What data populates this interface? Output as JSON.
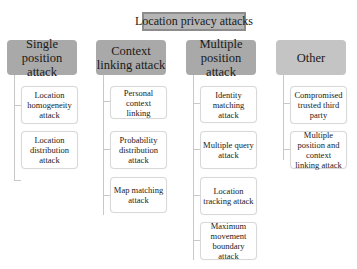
{
  "title": "Location privacy attacks",
  "colors": {
    "title_bg": "#b5b5b5",
    "title_border": "#8c8c8c",
    "category_dark": "#a9a9a9",
    "category_light": "#c4c4c4",
    "child_border": "#d8d8d8",
    "connector": "#c8c8c8"
  },
  "categories": [
    {
      "label": "Single position attack",
      "children": [
        "Location homogeneity attack",
        "Location distribution attack"
      ]
    },
    {
      "label": "Context linking attack",
      "children": [
        "Personal context linking",
        "Probability distribution attack",
        "Map matching attack"
      ]
    },
    {
      "label": "Multiple position attack",
      "children": [
        "Identity matching attack",
        "Multiple query attack",
        "Location tracking attack",
        "Maximum movement boundary attack"
      ]
    },
    {
      "label": "Other",
      "children": [
        "Compromised trusted third party",
        "Multiple position and context linking attack"
      ]
    }
  ]
}
